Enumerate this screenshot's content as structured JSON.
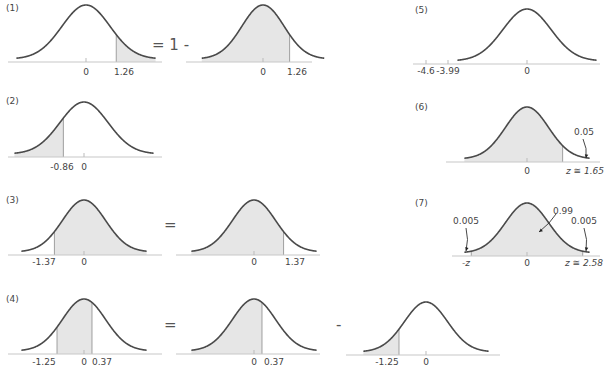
{
  "panels": [
    {
      "id": "1",
      "tag": "(1)",
      "operator": "= 1 -",
      "left": {
        "shade": "right",
        "cut": 1.26,
        "ticks": [
          "0",
          "1.26"
        ]
      },
      "right": {
        "shade": "left",
        "cut": 1.26,
        "ticks": [
          "0",
          "1.26"
        ]
      }
    },
    {
      "id": "2",
      "tag": "(2)",
      "curve": {
        "shade": "left",
        "cut": -0.86,
        "ticks": [
          "-0.86",
          "0"
        ]
      }
    },
    {
      "id": "3",
      "tag": "(3)",
      "operator": "=",
      "left": {
        "shade": "right",
        "cut": -1.37,
        "ticks": [
          "-1.37",
          "0"
        ]
      },
      "right": {
        "shade": "left",
        "cut": 1.37,
        "ticks": [
          "0",
          "1.37"
        ]
      }
    },
    {
      "id": "4",
      "tag": "(4)",
      "operator_eq": "=",
      "operator_minus": "-",
      "left": {
        "shade": "between",
        "from": -1.25,
        "to": 0.37,
        "ticks": [
          "-1.25",
          "0",
          "0.37"
        ]
      },
      "middle": {
        "shade": "left",
        "cut": 0.37,
        "ticks": [
          "0",
          "0.37"
        ]
      },
      "right": {
        "shade": "left",
        "cut": -1.25,
        "ticks": [
          "-1.25",
          "0"
        ]
      }
    },
    {
      "id": "5",
      "tag": "(5)",
      "curve": {
        "shade": "none",
        "ticks": [
          "-4.6",
          "-3.99",
          "0"
        ]
      }
    },
    {
      "id": "6",
      "tag": "(6)",
      "curve": {
        "shade": "left",
        "cut": 1.65,
        "ticks": [
          "0",
          "z ≅ 1.65"
        ],
        "annotation": "0.05"
      }
    },
    {
      "id": "7",
      "tag": "(7)",
      "curve": {
        "shade": "between",
        "from": -2.58,
        "to": 2.58,
        "ticks": [
          "-z",
          "0",
          "z ≅ 2.58"
        ],
        "annotations": {
          "left_tail": "0.005",
          "center": "0.99",
          "right_tail": "0.005"
        }
      }
    }
  ],
  "colors": {
    "curve": "#4a4a4a",
    "shade": "#e6e6e6",
    "axis": "#c8c8c8",
    "text": "#444444"
  }
}
